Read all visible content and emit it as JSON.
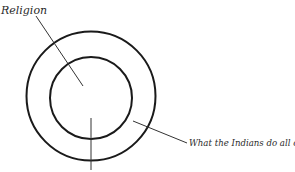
{
  "diagram": {
    "type": "concentric-circles",
    "labels": {
      "inner": "Religion",
      "outer_ring": "What the Indians do all of the time."
    },
    "colors": {
      "stroke": "#1a1a1a",
      "leader": "#333333",
      "text": "#2a2a2a",
      "background": "#ffffff"
    }
  }
}
